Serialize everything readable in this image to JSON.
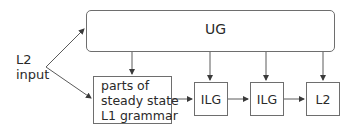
{
  "diagram": {
    "input_label": [
      "L2",
      "input"
    ],
    "ug_label": "UG",
    "source_box": [
      "parts of",
      "steady state",
      "L1 grammar"
    ],
    "stages": [
      "ILG",
      "ILG",
      "L2"
    ],
    "line_color": "#5a5a5a"
  }
}
